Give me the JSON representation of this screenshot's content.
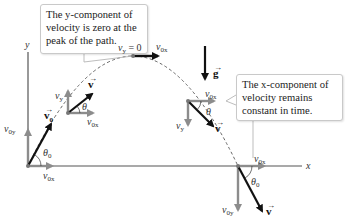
{
  "figure": {
    "type": "projectile-motion-diagram",
    "axes": {
      "x_label": "x",
      "y_label": "y"
    },
    "gravity": {
      "label": "g",
      "direction": "down"
    },
    "callouts": [
      {
        "id": "peak",
        "text": "The y-component of velocity is zero at the peak of the path.",
        "lines": [
          "The y-component of",
          "velocity is zero at the",
          "peak of the path."
        ]
      },
      {
        "id": "horizontal",
        "text": "The x-component of velocity remains constant in time.",
        "lines": [
          "The x-component of",
          "velocity remains",
          "constant in time."
        ]
      }
    ],
    "points": [
      {
        "id": "launch",
        "labels": {
          "velocity": "v",
          "velocity_sub": "0",
          "vx": "v",
          "vx_sub": "0x",
          "vy": "v",
          "vy_sub": "0y",
          "angle": "θ",
          "angle_sub": "0"
        }
      },
      {
        "id": "rising",
        "labels": {
          "velocity": "v",
          "vx": "v",
          "vx_sub": "0x",
          "vy": "v",
          "vy_sub": "y",
          "angle": "θ"
        }
      },
      {
        "id": "peak",
        "labels": {
          "vy_zero": "v",
          "vy_zero_sub": "y",
          "vy_zero_eq": " = 0",
          "vx": "v",
          "vx_sub": "0x"
        }
      },
      {
        "id": "falling",
        "labels": {
          "velocity": "v",
          "vx": "v",
          "vx_sub": "0x",
          "vy": "v",
          "vy_sub": "y",
          "angle": "θ"
        }
      },
      {
        "id": "landing",
        "labels": {
          "velocity": "v",
          "vx": "v",
          "vx_sub": "0x",
          "vy": "v",
          "vy_sub": "0y",
          "angle": "θ",
          "angle_sub": "0"
        }
      }
    ],
    "colors": {
      "velocity": "#111111",
      "component": "#8c8c8c",
      "axis": "#555555",
      "path": "#555555",
      "callout_border": "#c9c9c9"
    }
  }
}
